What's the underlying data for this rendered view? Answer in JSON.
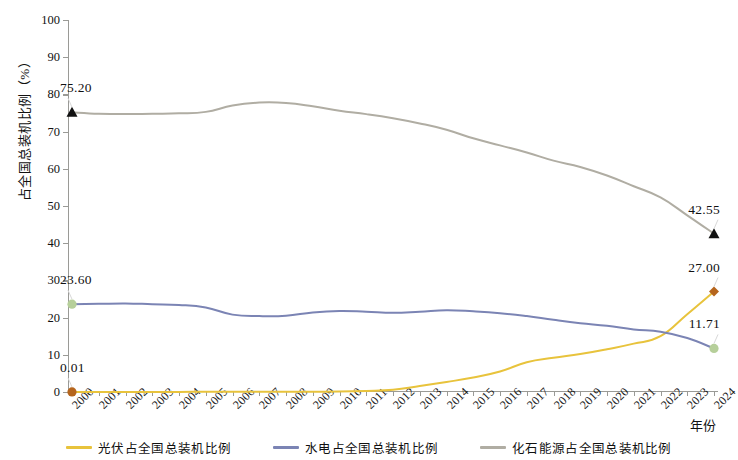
{
  "chart_data": {
    "type": "line",
    "title": "",
    "xlabel": "年份",
    "ylabel": "占全国总装机比例（%）",
    "xlim": [
      2000,
      2024
    ],
    "ylim": [
      0,
      100
    ],
    "ytick_step": 10,
    "grid": false,
    "legend_position": "bottom",
    "categories": [
      "2000",
      "2001",
      "2002",
      "2003",
      "2004",
      "2005",
      "2006",
      "2007",
      "2008",
      "2009",
      "2010",
      "2011",
      "2012",
      "2013",
      "2014",
      "2015",
      "2016",
      "2017",
      "2018",
      "2019",
      "2020",
      "2021",
      "2022",
      "2023",
      "2024"
    ],
    "yticks": [
      "0",
      "10",
      "20",
      "30",
      "40",
      "50",
      "60",
      "70",
      "80",
      "90",
      "100"
    ],
    "series": [
      {
        "name": "光伏占全国总装机比例",
        "color": "#e8c33c",
        "marker_color": "#b5651d",
        "values": [
          0.01,
          0.01,
          0.02,
          0.02,
          0.03,
          0.04,
          0.05,
          0.06,
          0.07,
          0.09,
          0.12,
          0.28,
          0.6,
          1.6,
          2.7,
          3.9,
          5.5,
          8.0,
          9.2,
          10.2,
          11.5,
          13.0,
          15.0,
          20.9,
          27.0
        ]
      },
      {
        "name": "水电占全国总装机比例",
        "color": "#7b84b4",
        "marker_color": "#b6cf9a",
        "values": [
          23.6,
          23.7,
          23.8,
          23.6,
          23.4,
          22.7,
          20.8,
          20.4,
          20.5,
          21.4,
          21.8,
          21.6,
          21.3,
          21.6,
          22.0,
          21.7,
          21.2,
          20.4,
          19.4,
          18.5,
          17.8,
          16.8,
          16.2,
          14.5,
          11.71
        ]
      },
      {
        "name": "化石能源占全国总装机比例",
        "color": "#b0ada3",
        "marker_color": "#111111",
        "values": [
          75.2,
          74.8,
          74.7,
          74.8,
          74.9,
          75.3,
          77.0,
          77.8,
          77.7,
          76.8,
          75.6,
          74.7,
          73.6,
          72.2,
          70.5,
          68.2,
          66.3,
          64.4,
          62.2,
          60.5,
          58.2,
          55.3,
          52.3,
          47.5,
          42.55
        ]
      }
    ],
    "annotations": [
      {
        "text": "75.20",
        "series": "化石能源占全国总装机比例",
        "x": "2000",
        "y": 75.2,
        "marker": "triangle",
        "color": "#111111"
      },
      {
        "text": "23.60",
        "series": "水电占全国总装机比例",
        "x": "2000",
        "y": 23.6,
        "marker": "circle",
        "color": "#b6cf9a"
      },
      {
        "text": "0.01",
        "series": "光伏占全国总装机比例",
        "x": "2000",
        "y": 0.01,
        "marker": "circle",
        "color": "#b5651d"
      },
      {
        "text": "42.55",
        "series": "化石能源占全国总装机比例",
        "x": "2024",
        "y": 42.55,
        "marker": "triangle",
        "color": "#111111"
      },
      {
        "text": "27.00",
        "series": "光伏占全国总装机比例",
        "x": "2024",
        "y": 27.0,
        "marker": "diamond",
        "color": "#b5651d"
      },
      {
        "text": "11.71",
        "series": "水电占全国总装机比例",
        "x": "2024",
        "y": 11.71,
        "marker": "circle",
        "color": "#b6cf9a"
      }
    ]
  },
  "legend": {
    "items": [
      {
        "label": "光伏占全国总装机比例",
        "color": "#e8c33c"
      },
      {
        "label": "水电占全国总装机比例",
        "color": "#7b84b4"
      },
      {
        "label": "化石能源占全国总装机比例",
        "color": "#b0ada3"
      }
    ]
  }
}
